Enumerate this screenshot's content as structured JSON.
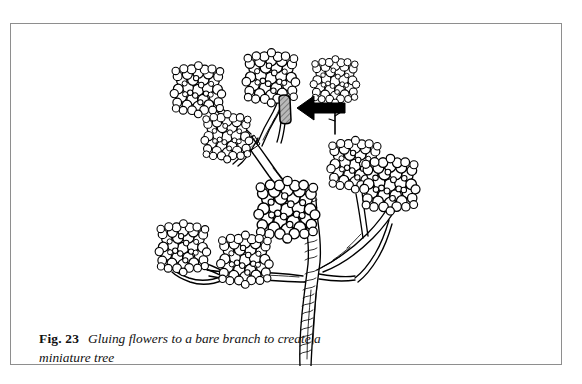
{
  "figure": {
    "label": "Fig. 23",
    "caption": "Gluing flowers to a bare branch to create a miniature tree",
    "border_color": "#8e8e8e",
    "background_color": "#ffffff",
    "ink_color": "#000000",
    "glue_fill_color": "#9a9a9a"
  },
  "illustration": {
    "title": "miniature-tree-line-drawing",
    "description": "Pen-and-ink line drawing of a bare forked branch standing upright, with round pom-pom dried flower heads glued onto the branch tips. A solid black arrow at the upper right points to a shaded blob of glue on one bare twig, and a separate detached flower head with a short stem waits to the right of the arrow.",
    "annotation": {
      "arrow": "arrow-pointing-to-glue-blob",
      "arrow_direction": "left",
      "target": "glue-blob-on-twig"
    },
    "flower_heads": [
      {
        "name": "flower-upper-left",
        "cx": 187,
        "cy": 66,
        "r": 26
      },
      {
        "name": "flower-upper-mid",
        "cx": 216,
        "cy": 113,
        "r": 24
      },
      {
        "name": "flower-top-center",
        "cx": 260,
        "cy": 54,
        "r": 27
      },
      {
        "name": "flower-top-right-detached",
        "cx": 324,
        "cy": 57,
        "r": 23
      },
      {
        "name": "flower-center",
        "cx": 275,
        "cy": 185,
        "r": 31
      },
      {
        "name": "flower-right-upper",
        "cx": 343,
        "cy": 140,
        "r": 26
      },
      {
        "name": "flower-right-lower",
        "cx": 378,
        "cy": 160,
        "r": 28
      },
      {
        "name": "flower-lower-left",
        "cx": 172,
        "cy": 224,
        "r": 26
      },
      {
        "name": "flower-lower-mid",
        "cx": 234,
        "cy": 235,
        "r": 26
      }
    ],
    "glue_blob": {
      "name": "glue-blob",
      "cx": 274,
      "cy": 86,
      "w": 13,
      "h": 25
    },
    "trunk": {
      "name": "tree-trunk",
      "base_x": 296,
      "base_y": 350,
      "fork_y": 245
    }
  }
}
